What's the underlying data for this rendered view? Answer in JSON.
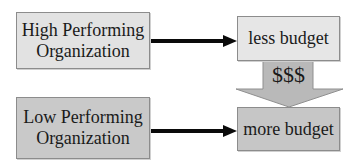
{
  "diagram": {
    "nodes": {
      "high_org": {
        "line1": "High Performing",
        "line2": "Organization",
        "fill": "#e2e2e2"
      },
      "low_org": {
        "line1": "Low Performing",
        "line2": "Organization",
        "fill": "#c9c9c9"
      },
      "less_budget": {
        "label": "less budget",
        "fill": "#e6e6e6"
      },
      "more_budget": {
        "label": "more budget",
        "fill": "#c6c6c6"
      }
    },
    "transfer_arrow": {
      "label": "$$$",
      "fill": "#b9b9b9"
    },
    "edges": [
      {
        "from": "high_org",
        "to": "less_budget"
      },
      {
        "from": "low_org",
        "to": "more_budget"
      },
      {
        "from": "less_budget",
        "to": "more_budget",
        "label": "$$$"
      }
    ],
    "arrow_color": "#0a0a0a"
  }
}
